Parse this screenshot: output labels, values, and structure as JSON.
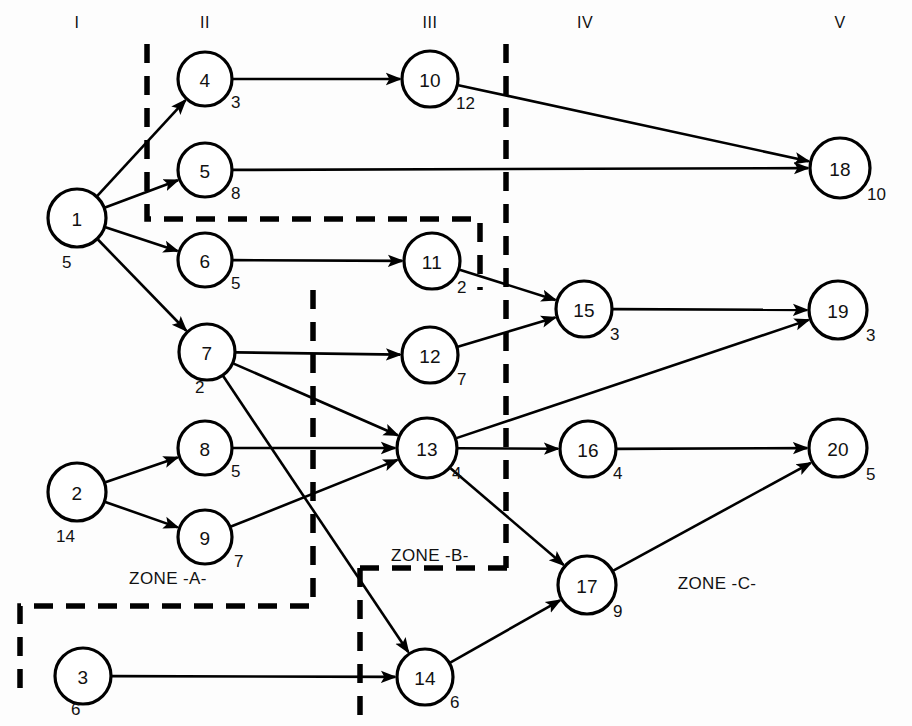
{
  "diagram": {
    "title_text": "",
    "column_headers": [
      {
        "label": "I",
        "x": 77,
        "y": 22
      },
      {
        "label": "II",
        "x": 205,
        "y": 22
      },
      {
        "label": "III",
        "x": 430,
        "y": 22
      },
      {
        "label": "IV",
        "x": 585,
        "y": 22
      },
      {
        "label": "V",
        "x": 840,
        "y": 22
      }
    ],
    "nodes": [
      {
        "id": "1",
        "label": "1",
        "weight": "5",
        "cx": 77,
        "cy": 218,
        "r": 29,
        "wx": 62,
        "wy": 262
      },
      {
        "id": "2",
        "label": "2",
        "weight": "14",
        "cx": 77,
        "cy": 492,
        "r": 29,
        "wx": 56,
        "wy": 536
      },
      {
        "id": "3",
        "label": "3",
        "weight": "6",
        "cx": 83,
        "cy": 676,
        "r": 28,
        "wx": 71,
        "wy": 709
      },
      {
        "id": "4",
        "label": "4",
        "weight": "3",
        "cx": 205,
        "cy": 79,
        "r": 27,
        "wx": 231,
        "wy": 102
      },
      {
        "id": "5",
        "label": "5",
        "weight": "8",
        "cx": 205,
        "cy": 170,
        "r": 27,
        "wx": 231,
        "wy": 193
      },
      {
        "id": "6",
        "label": "6",
        "weight": "5",
        "cx": 205,
        "cy": 260,
        "r": 27,
        "wx": 231,
        "wy": 283
      },
      {
        "id": "7",
        "label": "7",
        "weight": "2",
        "cx": 207,
        "cy": 352,
        "r": 28,
        "wx": 195,
        "wy": 387
      },
      {
        "id": "8",
        "label": "8",
        "weight": "5",
        "cx": 205,
        "cy": 448,
        "r": 27,
        "wx": 231,
        "wy": 471
      },
      {
        "id": "9",
        "label": "9",
        "weight": "7",
        "cx": 205,
        "cy": 537,
        "r": 27,
        "wx": 234,
        "wy": 561
      },
      {
        "id": "10",
        "label": "10",
        "weight": "12",
        "cx": 430,
        "cy": 79,
        "r": 28,
        "wx": 456,
        "wy": 103
      },
      {
        "id": "11",
        "label": "11",
        "weight": "2",
        "cx": 432,
        "cy": 261,
        "r": 28,
        "wx": 457,
        "wy": 287
      },
      {
        "id": "12",
        "label": "12",
        "weight": "7",
        "cx": 430,
        "cy": 355,
        "r": 28,
        "wx": 457,
        "wy": 379
      },
      {
        "id": "13",
        "label": "13",
        "weight": "4",
        "cx": 427,
        "cy": 448,
        "r": 30,
        "wx": 452,
        "wy": 473
      },
      {
        "id": "14",
        "label": "14",
        "weight": "6",
        "cx": 425,
        "cy": 677,
        "r": 28,
        "wx": 450,
        "wy": 702
      },
      {
        "id": "15",
        "label": "15",
        "weight": "3",
        "cx": 584,
        "cy": 309,
        "r": 28,
        "wx": 610,
        "wy": 334
      },
      {
        "id": "16",
        "label": "16",
        "weight": "4",
        "cx": 588,
        "cy": 449,
        "r": 28,
        "wx": 613,
        "wy": 473
      },
      {
        "id": "17",
        "label": "17",
        "weight": "9",
        "cx": 587,
        "cy": 585,
        "r": 29,
        "wx": 613,
        "wy": 611
      },
      {
        "id": "18",
        "label": "18",
        "weight": "10",
        "cx": 840,
        "cy": 168,
        "r": 30,
        "wx": 867,
        "wy": 194
      },
      {
        "id": "19",
        "label": "19",
        "weight": "3",
        "cx": 838,
        "cy": 310,
        "r": 29,
        "wx": 866,
        "wy": 335
      },
      {
        "id": "20",
        "label": "20",
        "weight": "5",
        "cx": 838,
        "cy": 448,
        "r": 29,
        "wx": 866,
        "wy": 474
      }
    ],
    "edges": [
      {
        "from": "1",
        "to": "4"
      },
      {
        "from": "1",
        "to": "5"
      },
      {
        "from": "1",
        "to": "6"
      },
      {
        "from": "1",
        "to": "7"
      },
      {
        "from": "2",
        "to": "8"
      },
      {
        "from": "2",
        "to": "9"
      },
      {
        "from": "3",
        "to": "14"
      },
      {
        "from": "4",
        "to": "10"
      },
      {
        "from": "5",
        "to": "18"
      },
      {
        "from": "6",
        "to": "11"
      },
      {
        "from": "7",
        "to": "12"
      },
      {
        "from": "7",
        "to": "13"
      },
      {
        "from": "7",
        "to": "14"
      },
      {
        "from": "8",
        "to": "13"
      },
      {
        "from": "9",
        "to": "13"
      },
      {
        "from": "10",
        "to": "18"
      },
      {
        "from": "11",
        "to": "15"
      },
      {
        "from": "12",
        "to": "15"
      },
      {
        "from": "13",
        "to": "16"
      },
      {
        "from": "13",
        "to": "17"
      },
      {
        "from": "13",
        "to": "19"
      },
      {
        "from": "14",
        "to": "17"
      },
      {
        "from": "15",
        "to": "19"
      },
      {
        "from": "16",
        "to": "20"
      },
      {
        "from": "17",
        "to": "20"
      }
    ],
    "zones": [
      {
        "name": "ZONE -A-",
        "label": "ZONE -A-",
        "lx": 168,
        "ly": 578
      },
      {
        "name": "ZONE -B-",
        "label": "ZONE -B-",
        "lx": 430,
        "ly": 555
      },
      {
        "name": "ZONE -C-",
        "label": "ZONE -C-",
        "lx": 717,
        "ly": 583
      }
    ],
    "zone_boundaries": [
      {
        "name": "zone-a-upper-left",
        "d": "M 147 44 L 147 219 L 480 219 L 480 290"
      },
      {
        "name": "zone-a-lower",
        "d": "M 313 290 L 313 606 L 20 606 L 20 693"
      },
      {
        "name": "zone-b-left",
        "d": "M 360 568 L 360 726"
      },
      {
        "name": "zone-b-bottom",
        "d": "M 360 568 L 512 568"
      },
      {
        "name": "zone-iv-divider",
        "d": "M 506 44 L 506 568"
      }
    ],
    "colors": {
      "stroke": "#000000",
      "background": "#fdfdfd",
      "node_fill": "#ffffff"
    }
  }
}
